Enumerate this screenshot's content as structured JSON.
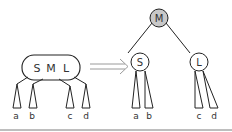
{
  "diagram": {
    "colors": {
      "stroke": "#222222",
      "root_fill": "#c8c8c8",
      "node_fill": "#ffffff",
      "arrow": "#9a9a9a",
      "baseline": "#a8a8a8",
      "text": "#333333"
    },
    "left": {
      "node_keys": [
        "S",
        "M",
        "L"
      ],
      "subtrees": [
        "a",
        "b",
        "c",
        "d"
      ]
    },
    "arrow": "double-arrow-right",
    "right": {
      "root": "M",
      "left_child": "S",
      "right_child": "L",
      "left_subtrees": [
        "a",
        "b"
      ],
      "right_subtrees": [
        "c",
        "d"
      ]
    }
  }
}
